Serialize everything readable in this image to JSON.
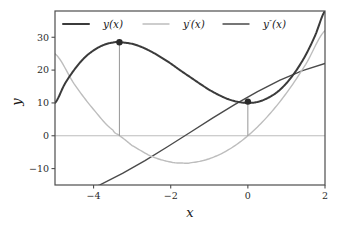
{
  "chart_data": {
    "type": "line",
    "title": "",
    "xlabel": "x",
    "ylabel": "y",
    "xlim": [
      -5,
      2
    ],
    "ylim": [
      -15,
      38
    ],
    "xticks": [
      -4,
      -2,
      0,
      2
    ],
    "xticklabels": [
      "−4",
      "−2",
      "0",
      "2"
    ],
    "yticks": [
      -10,
      0,
      10,
      20,
      30
    ],
    "yticklabels": [
      "−10",
      "0",
      "10",
      "20",
      "30"
    ],
    "grid": false,
    "legend_position": "upper center",
    "series": [
      {
        "name": "y(x)",
        "label_base": "y",
        "label_prime": "",
        "color": "#3b3b3b",
        "linewidth": 2.0,
        "expression": "x^3 + 5x^2 + 10",
        "x": [
          -5,
          -4.75,
          -4.5,
          -4.25,
          -4,
          -3.75,
          -3.5,
          -3.33,
          -3,
          -2.75,
          -2.5,
          -2.25,
          -2,
          -1.75,
          -1.5,
          -1.25,
          -1,
          -0.75,
          -0.5,
          -0.25,
          0,
          0.25,
          0.5,
          0.75,
          1,
          1.25,
          1.5,
          1.75,
          2
        ],
        "y": [
          10.0,
          15.7,
          20.1,
          23.6,
          26.0,
          27.6,
          28.4,
          28.5,
          28.0,
          27.0,
          25.6,
          23.9,
          22.0,
          19.9,
          17.9,
          15.9,
          14.0,
          12.4,
          11.1,
          10.3,
          10.0,
          10.3,
          11.4,
          13.2,
          16.0,
          19.8,
          24.6,
          30.7,
          38.0
        ]
      },
      {
        "name": "y'(x)",
        "label_base": "y",
        "label_prime": "′",
        "color": "#bdbdbd",
        "linewidth": 1.4,
        "expression": "3x^2 + 10x",
        "x": [
          -5,
          -4.5,
          -4,
          -3.5,
          -3.33,
          -3,
          -2.5,
          -2,
          -1.67,
          -1.5,
          -1,
          -0.5,
          0,
          0.5,
          1,
          1.5,
          2
        ],
        "y": [
          25.0,
          15.75,
          8.0,
          1.75,
          0.0,
          -3.0,
          -6.25,
          -8.0,
          -8.33,
          -8.25,
          -7.0,
          -4.25,
          0.0,
          5.75,
          13.0,
          21.75,
          32.0
        ]
      },
      {
        "name": "y''(x)",
        "label_base": "y",
        "label_prime": "″",
        "color": "#4a4a4a",
        "linewidth": 1.4,
        "expression": "6x + 10",
        "x": [
          -5,
          2
        ],
        "y": [
          -20.0,
          22.0
        ]
      }
    ],
    "markers": [
      {
        "name": "local-maximum",
        "x": -3.33,
        "y": 28.5,
        "color": "#2b2b2b",
        "dropline_to": 0
      },
      {
        "name": "local-minimum",
        "x": 0.0,
        "y": 10.4,
        "color": "#2b2b2b",
        "dropline_to": 0
      }
    ],
    "zero_line": {
      "y": 0,
      "color": "#bdbdbd"
    },
    "dropline_color": "#8a8a8a",
    "frame_color": "#4d4d4d",
    "background": "#ffffff"
  },
  "legend": {
    "entries": [
      {
        "label": "y(x)",
        "base": "y",
        "prime": "",
        "suffix": "(x)"
      },
      {
        "label": "y′(x)",
        "base": "y",
        "prime": "′",
        "suffix": "(x)"
      },
      {
        "label": "y″(x)",
        "base": "y",
        "prime": "″",
        "suffix": "(x)"
      }
    ]
  },
  "axes": {
    "xlabel": "x",
    "ylabel": "y"
  }
}
